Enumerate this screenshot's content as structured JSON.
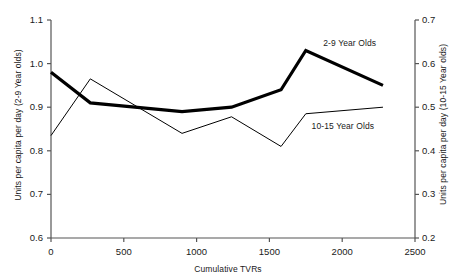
{
  "chart_data": {
    "type": "line",
    "title": "",
    "xlabel": "Cumulative TVRs",
    "ylabel": "Units per capita per day (2-9 Year olds)",
    "y2label": "Units per capita per day (10-15 Year olds)",
    "xlim": [
      0,
      2500
    ],
    "ylim": [
      0.6,
      1.1
    ],
    "y2lim": [
      0.2,
      0.7
    ],
    "xticks": [
      "0",
      "500",
      "1000",
      "1500",
      "2000",
      "2500"
    ],
    "xtick_values": [
      0,
      500,
      1000,
      1500,
      2000,
      2500
    ],
    "yticks": [
      "0.6",
      "0.7",
      "0.8",
      "0.9",
      "1.0",
      "1.1"
    ],
    "ytick_values": [
      0.6,
      0.7,
      0.8,
      0.9,
      1.0,
      1.1
    ],
    "y2ticks": [
      "0.2",
      "0.3",
      "0.4",
      "0.5",
      "0.6",
      "0.7"
    ],
    "y2tick_values": [
      0.2,
      0.3,
      0.4,
      0.5,
      0.6,
      0.7
    ],
    "grid": false,
    "legend_position": "inline-annotations",
    "series": [
      {
        "name": "2-9 Year Olds",
        "axis": "left",
        "line_width": 3.2,
        "color": "#000000",
        "label_x": 1870,
        "label_y": 1.045,
        "x": [
          0,
          270,
          900,
          1240,
          1580,
          1750,
          2280
        ],
        "values": [
          0.98,
          0.91,
          0.89,
          0.9,
          0.94,
          1.03,
          0.95
        ]
      },
      {
        "name": "10-15 Year Olds",
        "axis": "right",
        "line_width": 1.0,
        "color": "#000000",
        "label_x": 1790,
        "label_y": 0.455,
        "x": [
          0,
          270,
          900,
          1240,
          1580,
          1750,
          2280
        ],
        "values": [
          0.435,
          0.565,
          0.44,
          0.478,
          0.41,
          0.485,
          0.5
        ]
      }
    ]
  }
}
